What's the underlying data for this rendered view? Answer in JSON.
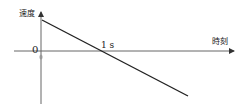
{
  "diagram": {
    "type": "velocity-time graph",
    "y_axis_label": "速度",
    "x_axis_label": "時刻",
    "origin_label": "0",
    "x_tick_label": "1 s",
    "line": {
      "description": "straight line with negative slope starting at positive velocity on the y-axis, crossing zero at t = 1 s and continuing into negative velocity",
      "start": {
        "t": 0,
        "v": "positive"
      },
      "zero_crossing_t": "1 s"
    },
    "colors": {
      "line": "#222222",
      "axis": "#555555",
      "background": "#ffffff"
    }
  }
}
